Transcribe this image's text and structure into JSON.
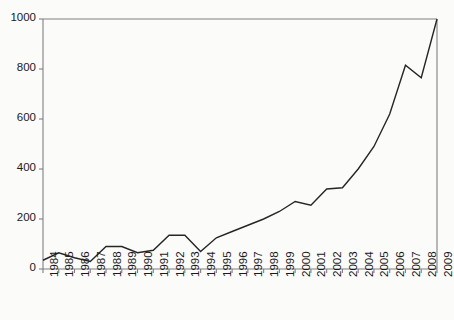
{
  "chart_data": {
    "type": "line",
    "title": "",
    "subtitle": "",
    "xlabel": "",
    "ylabel": "",
    "xlim": [
      1984,
      2009
    ],
    "ylim": [
      0,
      1000
    ],
    "grid": false,
    "legend": false,
    "legend_position": "none",
    "line_color": "#262626",
    "background_color": "#fbfbfa",
    "axis_color": "#808080",
    "x": [
      1984,
      1985,
      1986,
      1987,
      1988,
      1989,
      1990,
      1991,
      1992,
      1993,
      1994,
      1995,
      1996,
      1997,
      1998,
      1999,
      2000,
      2001,
      2002,
      2003,
      2004,
      2005,
      2006,
      2007,
      2008,
      2009
    ],
    "categories": [
      "1984",
      "1985",
      "1986",
      "1987",
      "1988",
      "1989",
      "1990",
      "1991",
      "1992",
      "1993",
      "1994",
      "1995",
      "1996",
      "1997",
      "1998",
      "1999",
      "2000",
      "2001",
      "2002",
      "2003",
      "2004",
      "2005",
      "2006",
      "2007",
      "2008",
      "2009"
    ],
    "values": [
      35,
      65,
      45,
      30,
      90,
      90,
      65,
      75,
      135,
      135,
      70,
      125,
      150,
      175,
      200,
      230,
      270,
      255,
      320,
      325,
      400,
      490,
      620,
      815,
      765,
      1000
    ],
    "series": [
      {
        "name": "series-1",
        "values": [
          35,
          65,
          45,
          30,
          90,
          90,
          65,
          75,
          135,
          135,
          70,
          125,
          150,
          175,
          200,
          230,
          270,
          255,
          320,
          325,
          400,
          490,
          620,
          815,
          765,
          1000
        ]
      }
    ],
    "yticks": [
      0,
      200,
      400,
      600,
      800,
      1000
    ],
    "ytick_labels": [
      "0",
      "200",
      "400",
      "600",
      "800",
      "1000"
    ],
    "xtick_labels": [
      "1984",
      "1985",
      "1986",
      "1987",
      "1988",
      "1989",
      "1990",
      "1991",
      "1992",
      "1993",
      "1994",
      "1995",
      "1996",
      "1997",
      "1998",
      "1999",
      "2000",
      "2001",
      "2002",
      "2003",
      "2004",
      "2005",
      "2006",
      "2007",
      "2008",
      "2009"
    ]
  }
}
